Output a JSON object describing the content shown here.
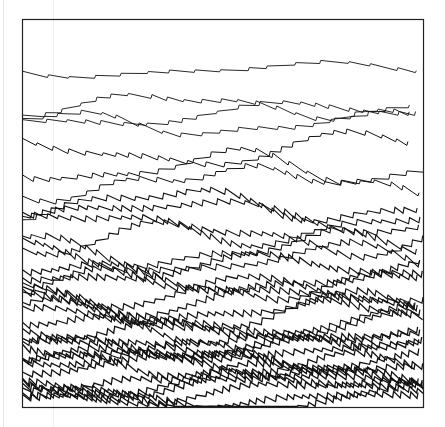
{
  "figure": {
    "background": "#ffffff",
    "stroke_color": "#111111",
    "frame": {
      "x": 22.5,
      "y": 19.5,
      "width": 401,
      "height": 388,
      "stroke": "#222222",
      "stroke_width": 1.2
    },
    "line_groups": [
      {
        "y_start": 70,
        "y_end": 70,
        "count": 1,
        "amplitude": 3,
        "tooth": 22,
        "drift": 6,
        "stroke_width": 0.9
      },
      {
        "y_start": 106,
        "y_end": 124,
        "count": 3,
        "amplitude": 4,
        "tooth": 18,
        "drift": 10,
        "stroke_width": 0.9
      },
      {
        "y_start": 150,
        "y_end": 185,
        "count": 3,
        "amplitude": 5,
        "tooth": 14,
        "drift": 14,
        "stroke_width": 1.0
      },
      {
        "y_start": 205,
        "y_end": 260,
        "count": 6,
        "amplitude": 6,
        "tooth": 11,
        "drift": 14,
        "stroke_width": 1.1
      },
      {
        "y_start": 270,
        "y_end": 330,
        "count": 9,
        "amplitude": 6.5,
        "tooth": 9,
        "drift": 12,
        "stroke_width": 1.2
      },
      {
        "y_start": 335,
        "y_end": 402,
        "count": 14,
        "amplitude": 6.5,
        "tooth": 8,
        "drift": 10,
        "stroke_width": 1.3
      }
    ],
    "seed": 7
  }
}
